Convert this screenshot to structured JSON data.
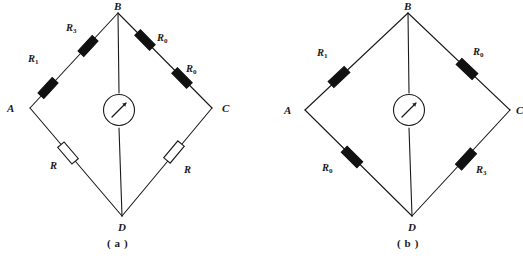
{
  "figure": {
    "background_color": "#ffffff",
    "line_color": "#1a1a1a",
    "resistor_fill_filled": "#111111",
    "resistor_fill_hollow": "#ffffff",
    "width": 521,
    "height": 261
  },
  "panels": [
    {
      "id": "a",
      "caption": "( a )",
      "nodes": [
        {
          "name": "A",
          "label": "A"
        },
        {
          "name": "B",
          "label": "B"
        },
        {
          "name": "C",
          "label": "C"
        },
        {
          "name": "D",
          "label": "D"
        }
      ],
      "meter": {
        "type": "galvanometer",
        "label": ""
      },
      "resistors": [
        {
          "name": "a-r1",
          "letter": "R",
          "subscript": "1",
          "style": "filled",
          "arm": "A-B"
        },
        {
          "name": "a-r3",
          "letter": "R",
          "subscript": "3",
          "style": "filled",
          "arm": "A-B"
        },
        {
          "name": "a-r0-top",
          "letter": "R",
          "subscript": "0",
          "style": "filled",
          "arm": "B-C"
        },
        {
          "name": "a-r0-low",
          "letter": "R",
          "subscript": "0",
          "style": "filled",
          "arm": "B-C"
        },
        {
          "name": "a-r-left",
          "letter": "R",
          "subscript": "",
          "style": "hollow",
          "arm": "A-D"
        },
        {
          "name": "a-r-right",
          "letter": "R",
          "subscript": "",
          "style": "hollow",
          "arm": "D-C"
        }
      ]
    },
    {
      "id": "b",
      "caption": "( b )",
      "nodes": [
        {
          "name": "A",
          "label": "A"
        },
        {
          "name": "B",
          "label": "B"
        },
        {
          "name": "C",
          "label": "C"
        },
        {
          "name": "D",
          "label": "D"
        }
      ],
      "meter": {
        "type": "galvanometer",
        "label": ""
      },
      "resistors": [
        {
          "name": "b-r1",
          "letter": "R",
          "subscript": "1",
          "style": "filled",
          "arm": "A-B"
        },
        {
          "name": "b-r0-top",
          "letter": "R",
          "subscript": "0",
          "style": "filled",
          "arm": "B-C"
        },
        {
          "name": "b-r0-bot",
          "letter": "R",
          "subscript": "0",
          "style": "filled",
          "arm": "A-D"
        },
        {
          "name": "b-r3",
          "letter": "R",
          "subscript": "3",
          "style": "filled",
          "arm": "D-C"
        }
      ]
    }
  ],
  "labels": {
    "R": "R",
    "sub_0": "0",
    "sub_1": "1",
    "sub_3": "3",
    "node_A": "A",
    "node_B": "B",
    "node_C": "C",
    "node_D": "D",
    "caption_a": "( a )",
    "caption_b": "( b )"
  }
}
